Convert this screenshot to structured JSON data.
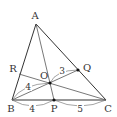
{
  "diagram": {
    "type": "triangle-cevians",
    "stroke_color": "#333333",
    "points": {
      "A": {
        "label": "A",
        "x": 36,
        "y": 24,
        "lx": 35,
        "ly": 19
      },
      "B": {
        "label": "B",
        "x": 12,
        "y": 100,
        "lx": 11,
        "ly": 112
      },
      "C": {
        "label": "C",
        "x": 106,
        "y": 100,
        "lx": 108,
        "ly": 112
      },
      "P": {
        "label": "P",
        "x": 54,
        "y": 100,
        "lx": 54,
        "ly": 112
      },
      "Q": {
        "label": "Q",
        "x": 78,
        "y": 70,
        "lx": 87,
        "ly": 71
      },
      "R": {
        "label": "R",
        "x": 19,
        "y": 74,
        "lx": 13,
        "ly": 72
      },
      "O": {
        "label": "O",
        "x": 50,
        "y": 83,
        "lx": 44,
        "ly": 79
      }
    },
    "segment_labels": {
      "OQ": {
        "text": "3",
        "x": 62,
        "y": 74
      },
      "BO": {
        "text": "4",
        "x": 28,
        "y": 90
      },
      "BP": {
        "text": "4",
        "x": 32,
        "y": 112
      },
      "PC": {
        "text": "5",
        "x": 80,
        "y": 112
      }
    }
  }
}
